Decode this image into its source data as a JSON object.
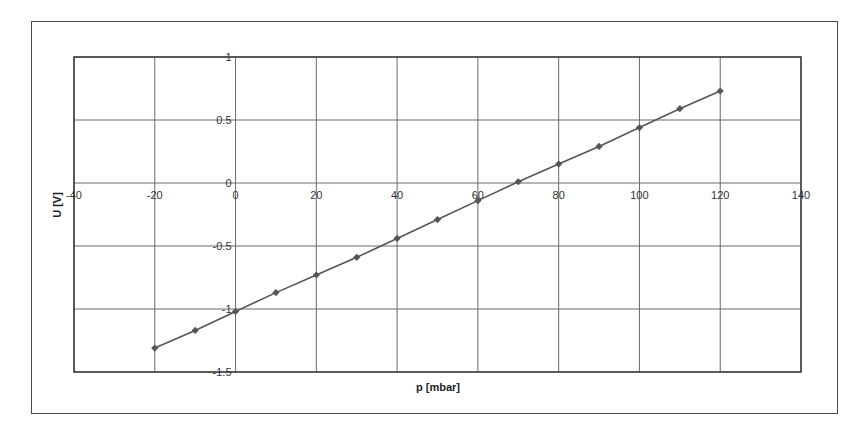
{
  "chart_data": {
    "type": "line",
    "title": "",
    "xlabel": "p [mbar]",
    "ylabel": "U [V]",
    "xlim": [
      -40,
      140
    ],
    "ylim": [
      -1.5,
      1
    ],
    "x_ticks": [
      -40,
      -20,
      0,
      20,
      40,
      60,
      80,
      100,
      120,
      140
    ],
    "y_ticks": [
      1,
      0.5,
      0,
      -0.5,
      -1,
      -1.5
    ],
    "grid": true,
    "legend": null,
    "series": [
      {
        "name": "U(p)",
        "marker": "diamond",
        "color": "#555555",
        "x": [
          -20,
          -10,
          0,
          10,
          20,
          30,
          40,
          50,
          60,
          70,
          80,
          90,
          100,
          110,
          120
        ],
        "values": [
          -1.31,
          -1.17,
          -1.02,
          -0.87,
          -0.73,
          -0.59,
          -0.44,
          -0.29,
          -0.14,
          0.01,
          0.15,
          0.29,
          0.44,
          0.59,
          0.73
        ]
      }
    ]
  },
  "colors": {
    "grid": "#6a6a6a",
    "line": "#555555",
    "frame": "#4a4a4a"
  }
}
